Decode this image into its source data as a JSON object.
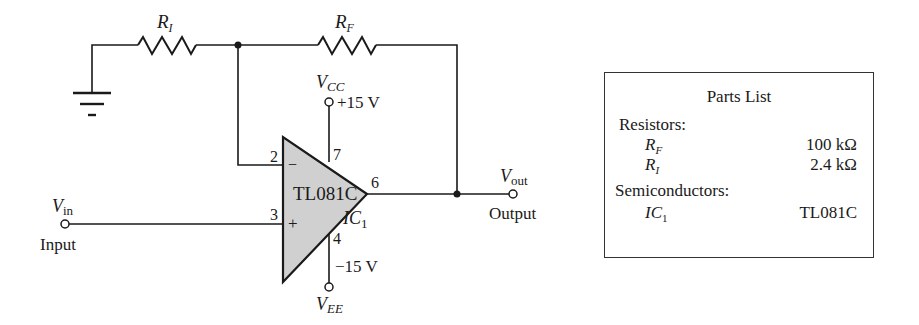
{
  "schematic": {
    "resistor_input": {
      "symbol": "R",
      "subscript": "I"
    },
    "resistor_feedback": {
      "symbol": "R",
      "subscript": "F"
    },
    "opamp": {
      "part": "TL081C",
      "designator": "IC",
      "designator_sub": "1",
      "pins": {
        "inverting": "2",
        "noninverting": "3",
        "vcc": "7",
        "vee": "4",
        "output": "6"
      },
      "inverting_sign": "−",
      "noninverting_sign": "+"
    },
    "vcc": {
      "symbol": "V",
      "subscript": "CC",
      "value": "+15 V"
    },
    "vee": {
      "symbol": "V",
      "subscript": "EE",
      "value": "−15 V"
    },
    "input": {
      "symbol": "V",
      "subscript": "in",
      "label": "Input"
    },
    "output": {
      "symbol": "V",
      "subscript": "out",
      "label": "Output"
    }
  },
  "parts_list": {
    "title": "Parts List",
    "categories": [
      {
        "label": "Resistors:",
        "items": [
          {
            "name": "R",
            "sub": "F",
            "value": "100 kΩ"
          },
          {
            "name": "R",
            "sub": "I",
            "value": "2.4 kΩ"
          }
        ]
      },
      {
        "label": "Semiconductors:",
        "items": [
          {
            "name": "IC",
            "sub": "1",
            "value": "TL081C"
          }
        ]
      }
    ]
  }
}
